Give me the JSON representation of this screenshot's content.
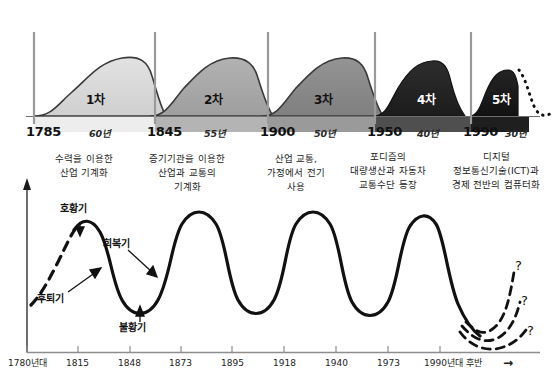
{
  "figure": {
    "title_hidden": "",
    "top_chart": {
      "name": "industrial-revolution-waves",
      "waves": [
        {
          "label": "1차",
          "fill": "#d9d9d9",
          "band": "#ededed",
          "text_dark": true
        },
        {
          "label": "2차",
          "fill": "#a8a8a8",
          "band": "#b4b4b4",
          "text_dark": false
        },
        {
          "label": "3차",
          "fill": "#8a8a8a",
          "band": "#9a9a9a",
          "text_dark": false
        },
        {
          "label": "4차",
          "fill": "#262626",
          "band": "#4f4f4f",
          "text_dark": false
        },
        {
          "label": "5차",
          "fill": "#1a1a1a",
          "band": "#1f1f1f",
          "text_dark": false
        }
      ],
      "year_marks": [
        "1785",
        "1845",
        "1900",
        "1950",
        "1990"
      ],
      "durations": [
        "60년",
        "55년",
        "50년",
        "40년",
        "30년"
      ],
      "descriptions": [
        "수력을 이용한\n산업 기계화",
        "증기기관을 이용한\n산업과 교통의\n기계화",
        "산업 교통,\n가정에서 전기\n사용",
        "포디즘의\n대량생산과 자동차\n교통수단 등장",
        "디지털\n정보통신기술(ICT)과\n경제 전반의 컴퓨터화"
      ]
    },
    "bottom_chart": {
      "name": "business-cycle-wave",
      "phase_labels": [
        {
          "key": "boom",
          "text": "호황기"
        },
        {
          "key": "recession",
          "text": "후퇴기"
        },
        {
          "key": "recovery",
          "text": "회복기"
        },
        {
          "key": "depression",
          "text": "불황기"
        }
      ],
      "axis_ticks": [
        "1780년대",
        "1815",
        "1848",
        "1873",
        "1895",
        "1918",
        "1940",
        "1973",
        "1990년대 후반"
      ],
      "future_markers": [
        "?",
        "?",
        "?"
      ],
      "arrow_glyph": "→"
    }
  },
  "chart_data": {
    "type": "area",
    "xlabel": "",
    "ylabel": "",
    "grid": false,
    "legend_position": "none",
    "series": [
      {
        "name": "industrial-revolution-waves",
        "type": "area",
        "categories": [
          "1차",
          "2차",
          "3차",
          "4차",
          "5차"
        ],
        "start_years": [
          1785,
          1845,
          1900,
          1950,
          1990
        ],
        "durations_years": [
          60,
          55,
          50,
          40,
          30
        ],
        "peak_heights_rel": [
          1.0,
          0.95,
          0.93,
          0.88,
          0.78
        ],
        "shade_values": [
          "#d9d9d9",
          "#a8a8a8",
          "#8a8a8a",
          "#262626",
          "#1a1a1a"
        ]
      },
      {
        "name": "business-cycle",
        "type": "line",
        "x": [
          1780,
          1815,
          1848,
          1873,
          1895,
          1918,
          1940,
          1973,
          1995
        ],
        "phase_at_x": [
          "시작(점선)",
          "호황기(정점)",
          "불황기(저점)",
          "호황기(정점)",
          "불황기(저점)",
          "호황기(정점)",
          "불황기(저점)",
          "호황기(정점)",
          "미래(점선)"
        ],
        "values": [
          0.15,
          1.0,
          0.0,
          1.0,
          0.0,
          1.0,
          0.0,
          1.0,
          0.1
        ]
      }
    ],
    "annotations": [
      {
        "text": "호황기",
        "x": 1815,
        "note": "peak"
      },
      {
        "text": "후퇴기",
        "x": 1830,
        "note": "downswing"
      },
      {
        "text": "회복기",
        "x": 1860,
        "note": "upswing"
      },
      {
        "text": "불황기",
        "x": 1848,
        "note": "trough"
      },
      {
        "text": "?",
        "x": 2005,
        "note": "future-branch-high"
      },
      {
        "text": "?",
        "x": 2005,
        "note": "future-branch-mid"
      },
      {
        "text": "?",
        "x": 2005,
        "note": "future-branch-low"
      }
    ]
  }
}
